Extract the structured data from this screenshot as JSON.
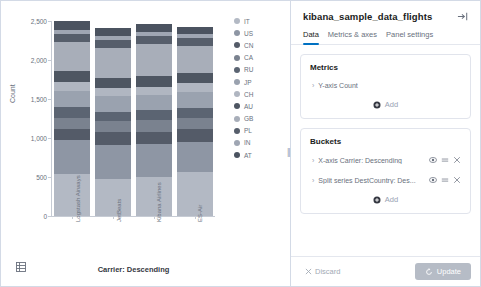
{
  "chart_data": {
    "type": "bar",
    "stacked": true,
    "title": "",
    "xlabel": "Carrier: Descending",
    "ylabel": "Count",
    "ylim": [
      0,
      2500
    ],
    "yticks": [
      "0",
      "500",
      "1,000",
      "1,500",
      "2,000",
      "2,500"
    ],
    "ytick_values": [
      0,
      500,
      1000,
      1500,
      2000,
      2500
    ],
    "grid": false,
    "legend_position": "right",
    "categories": [
      "Logstash Airways",
      "JetBeats",
      "Kibana Airlines",
      "ES-Air"
    ],
    "series": [
      {
        "name": "IT",
        "color": "#b3b9c4",
        "values": [
          540,
          470,
          500,
          560
        ]
      },
      {
        "name": "US",
        "color": "#8e96a4",
        "values": [
          430,
          440,
          420,
          390
        ]
      },
      {
        "name": "CN",
        "color": "#545b68",
        "values": [
          150,
          165,
          155,
          160
        ]
      },
      {
        "name": "CA",
        "color": "#7a828f",
        "values": [
          135,
          140,
          150,
          145
        ]
      },
      {
        "name": "RU",
        "color": "#5b6472",
        "values": [
          145,
          120,
          135,
          130
        ]
      },
      {
        "name": "JP",
        "color": "#9aa2af",
        "values": [
          205,
          210,
          195,
          200
        ]
      },
      {
        "name": "CH",
        "color": "#b0b6c1",
        "values": [
          110,
          100,
          105,
          115
        ]
      },
      {
        "name": "AU",
        "color": "#4e5662",
        "values": [
          145,
          130,
          140,
          135
        ]
      },
      {
        "name": "GB",
        "color": "#a8aeb9",
        "values": [
          375,
          385,
          400,
          345
        ]
      },
      {
        "name": "PL",
        "color": "#565e6b",
        "values": [
          100,
          95,
          105,
          100
        ]
      },
      {
        "name": "IN",
        "color": "#9fa6b3",
        "values": [
          55,
          50,
          60,
          50
        ]
      },
      {
        "name": "AT",
        "color": "#4b5360",
        "values": [
          110,
          105,
          100,
          100
        ]
      }
    ]
  },
  "chart_panel": {
    "grid_icon": "table-grid-icon"
  },
  "editor": {
    "title": "kibana_sample_data_flights",
    "collapse_icon": "collapse-panel-icon",
    "tabs": [
      {
        "label": "Data",
        "active": true
      },
      {
        "label": "Metrics & axes",
        "active": false
      },
      {
        "label": "Panel settings",
        "active": false
      }
    ],
    "metrics": {
      "title": "Metrics",
      "rows": [
        {
          "chevron": "›",
          "label": "Y-axis Count"
        }
      ],
      "add_label": "Add"
    },
    "buckets": {
      "title": "Buckets",
      "rows": [
        {
          "chevron": "›",
          "label": "X-axis Carrier: Descending"
        },
        {
          "chevron": "›",
          "label": "Split series DestCountry: Des..."
        }
      ],
      "add_label": "Add"
    },
    "footer": {
      "discard_label": "Discard",
      "update_label": "Update",
      "update_color": "#b6bcc6"
    }
  }
}
